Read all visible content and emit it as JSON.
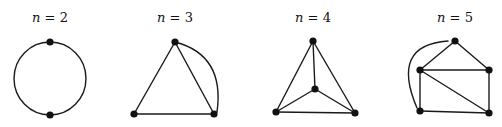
{
  "figure": {
    "panels": [
      {
        "id": "n2",
        "label_var": "n",
        "label_eq": " = ",
        "label_val": "2",
        "label_pos": [
          50,
          22
        ],
        "vertices": [
          [
            50,
            42
          ],
          [
            50,
            115
          ]
        ],
        "edges": [],
        "arcs": [
          "M 50 42 A 36 36.5 0 0 1 50 115",
          "M 50 42 A 36 36.5 0 0 0 50 115"
        ]
      },
      {
        "id": "n3",
        "label_var": "n",
        "label_eq": " = ",
        "label_val": "3",
        "label_pos": [
          175,
          22
        ],
        "vertices": [
          [
            175,
            42
          ],
          [
            134,
            114
          ],
          [
            214,
            114
          ]
        ],
        "edges": [
          [
            0,
            1
          ],
          [
            0,
            2
          ],
          [
            1,
            2
          ]
        ],
        "arcs": [
          "M 175 42 Q 225 55 217 112"
        ]
      },
      {
        "id": "n4",
        "label_var": "n",
        "label_eq": " = ",
        "label_val": "4",
        "label_pos": [
          313,
          22
        ],
        "vertices": [
          [
            313,
            41
          ],
          [
            315,
            89
          ],
          [
            276,
            112
          ],
          [
            355,
            113
          ]
        ],
        "edges": [
          [
            0,
            1
          ],
          [
            0,
            2
          ],
          [
            0,
            3
          ],
          [
            1,
            2
          ],
          [
            1,
            3
          ],
          [
            2,
            3
          ]
        ],
        "arcs": []
      },
      {
        "id": "n5",
        "label_var": "n",
        "label_eq": " = ",
        "label_val": "5",
        "label_pos": [
          455,
          22
        ],
        "vertices": [
          [
            455,
            41
          ],
          [
            420,
            70
          ],
          [
            489,
            70
          ],
          [
            420,
            111
          ],
          [
            489,
            113
          ]
        ],
        "edges": [
          [
            0,
            1
          ],
          [
            0,
            2
          ],
          [
            1,
            2
          ],
          [
            1,
            3
          ],
          [
            1,
            4
          ],
          [
            2,
            4
          ],
          [
            3,
            4
          ]
        ],
        "arcs": [
          "M 448 41 Q 390 45 417 108"
        ]
      }
    ]
  }
}
